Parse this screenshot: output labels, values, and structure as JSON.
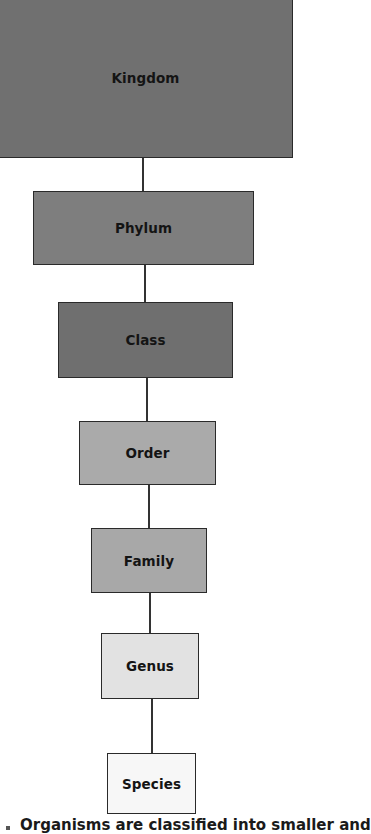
{
  "diagram": {
    "type": "hierarchy",
    "levels": [
      {
        "label": "Kingdom",
        "color": "#707070"
      },
      {
        "label": "Phylum",
        "color": "#7e7e7e"
      },
      {
        "label": "Class",
        "color": "#6f6f6f"
      },
      {
        "label": "Order",
        "color": "#aaaaaa"
      },
      {
        "label": "Family",
        "color": "#a8a8a8"
      },
      {
        "label": "Genus",
        "color": "#e2e2e2"
      },
      {
        "label": "Species",
        "color": "#f7f7f7"
      }
    ],
    "caption": "Organisms are classified into smaller and"
  }
}
